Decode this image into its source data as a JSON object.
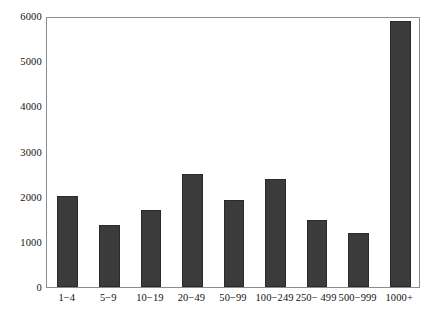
{
  "chart_data": {
    "type": "bar",
    "title": "",
    "xlabel": "",
    "ylabel": "",
    "categories": [
      "1−4",
      "5−9",
      "10−19",
      "20−49",
      "50−99",
      "100−249",
      "250− 499",
      "500−999",
      "1000+"
    ],
    "values": [
      2010,
      1370,
      1700,
      2500,
      1930,
      2400,
      1490,
      1190,
      5900
    ],
    "ylim": [
      0,
      6000
    ],
    "ytick_labels": [
      "0",
      "1000",
      "2000",
      "3000",
      "4000",
      "5000",
      "6000"
    ],
    "ytick_values": [
      0,
      1000,
      2000,
      3000,
      4000,
      5000,
      6000
    ],
    "grid": false,
    "legend": null,
    "bar_color": "#3b3b3b",
    "bar_edge_color": "#2a2a2a",
    "axis_color": "#8c8c8c",
    "background": "#ffffff"
  },
  "caption_remnant": ""
}
